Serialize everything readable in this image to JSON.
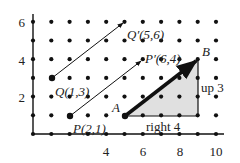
{
  "diagram": {
    "type": "coordinate-grid-translation",
    "axes": {
      "x_ticks": [
        4,
        6,
        8,
        10
      ],
      "y_ticks": [
        2,
        4,
        6
      ],
      "x_range": [
        0,
        10
      ],
      "y_range": [
        0,
        6
      ]
    },
    "points": {
      "Q": {
        "label": "Q(1,3)",
        "x": 1,
        "y": 3
      },
      "Q_prime": {
        "label": "Q′(5,6)",
        "x": 5,
        "y": 6
      },
      "P": {
        "label": "P(2,1)",
        "x": 2,
        "y": 1
      },
      "P_prime": {
        "label": "P′(6,4)",
        "x": 6,
        "y": 4
      },
      "A": {
        "label": "A",
        "x": 5,
        "y": 1
      },
      "B": {
        "label": "B",
        "x": 9,
        "y": 4
      }
    },
    "labels": {
      "horizontal_step": "right 4",
      "vertical_step": "up 3"
    },
    "colors": {
      "triangle_fill": "#e0e0e0",
      "line": "#111111",
      "dot": "#111111"
    }
  }
}
